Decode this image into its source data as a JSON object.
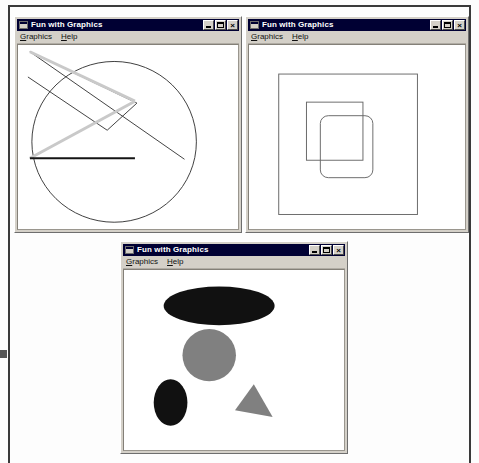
{
  "page": {
    "background_color": "#fdfdfd",
    "frame_color": "#3a3a3a"
  },
  "window_chrome": {
    "title": "Fun with Graphics",
    "icon_name": "window-document-icon",
    "titlebar_color": "#000033",
    "titlebar_text_color": "#ffffff",
    "face_color": "#d4d0c8",
    "buttons": {
      "minimize": "_",
      "maximize": "□",
      "close": "×"
    },
    "menus": [
      {
        "label": "Graphics",
        "accel": "G"
      },
      {
        "label": "Help",
        "accel": "H"
      }
    ]
  },
  "windows": [
    {
      "id": "window-lines",
      "title": "Fun with Graphics",
      "canvas_name": "lines-and-arc-canvas",
      "description": "Lines and large circle arc drawing"
    },
    {
      "id": "window-rects",
      "title": "Fun with Graphics",
      "canvas_name": "rectangles-canvas",
      "description": "Nested and overlapping rectangles drawing"
    },
    {
      "id": "window-shapes",
      "title": "Fun with Graphics",
      "canvas_name": "filled-shapes-canvas",
      "description": "Filled ovals, circle and triangle drawing"
    }
  ],
  "chart_data": [
    {
      "type": "scatter",
      "name": "lines-and-arc",
      "title": "Fun with Graphics - lines and arc",
      "viewbox": [
        0,
        0,
        222,
        190
      ],
      "shapes": [
        {
          "kind": "circle",
          "cx": 97,
          "cy": 100,
          "r": 83,
          "stroke": "#3c3c3c",
          "fill": "none",
          "stroke_width": 1
        },
        {
          "kind": "line",
          "x1": 12,
          "y1": 7,
          "x2": 168,
          "y2": 118,
          "stroke": "#404040",
          "stroke_width": 1
        },
        {
          "kind": "line",
          "x1": 12,
          "y1": 7,
          "x2": 120,
          "y2": 60,
          "stroke": "#404040",
          "stroke_width": 1
        },
        {
          "kind": "line",
          "x1": 120,
          "y1": 60,
          "x2": 90,
          "y2": 88,
          "stroke": "#404040",
          "stroke_width": 1
        },
        {
          "kind": "line",
          "x1": 90,
          "y1": 88,
          "x2": 10,
          "y2": 33,
          "stroke": "#404040",
          "stroke_width": 1
        },
        {
          "kind": "line",
          "x1": 12,
          "y1": 7,
          "x2": 118,
          "y2": 58,
          "stroke": "#c9c9c9",
          "stroke_width": 3
        },
        {
          "kind": "line",
          "x1": 118,
          "y1": 58,
          "x2": 12,
          "y2": 117,
          "stroke": "#c9c9c9",
          "stroke_width": 3
        },
        {
          "kind": "line",
          "x1": 12,
          "y1": 117,
          "x2": 118,
          "y2": 117,
          "stroke": "#141414",
          "stroke_width": 2
        }
      ]
    },
    {
      "type": "scatter",
      "name": "rectangles",
      "title": "Fun with Graphics - rectangles",
      "viewbox": [
        0,
        0,
        218,
        190
      ],
      "shapes": [
        {
          "kind": "rect",
          "x": 30,
          "y": 30,
          "w": 140,
          "h": 145,
          "rx": 0,
          "stroke": "#6a6a6a",
          "fill": "none",
          "stroke_width": 1
        },
        {
          "kind": "rect",
          "x": 58,
          "y": 59,
          "w": 57,
          "h": 60,
          "rx": 0,
          "stroke": "#6a6a6a",
          "fill": "none",
          "stroke_width": 1
        },
        {
          "kind": "rect",
          "x": 72,
          "y": 73,
          "w": 53,
          "h": 64,
          "rx": 8,
          "stroke": "#6a6a6a",
          "fill": "none",
          "stroke_width": 1
        }
      ]
    },
    {
      "type": "scatter",
      "name": "filled-shapes",
      "title": "Fun with Graphics - filled shapes",
      "viewbox": [
        0,
        0,
        222,
        186
      ],
      "shapes": [
        {
          "kind": "ellipse",
          "cx": 96,
          "cy": 37,
          "rx": 56,
          "ry": 20,
          "fill": "#111111"
        },
        {
          "kind": "circle",
          "cx": 86,
          "cy": 88,
          "r": 27,
          "fill": "#808080"
        },
        {
          "kind": "ellipse",
          "cx": 47,
          "cy": 137,
          "rx": 17,
          "ry": 24,
          "fill": "#111111"
        },
        {
          "kind": "polygon",
          "points": "131,118 150,152 112,145",
          "fill": "#808080"
        }
      ]
    }
  ]
}
